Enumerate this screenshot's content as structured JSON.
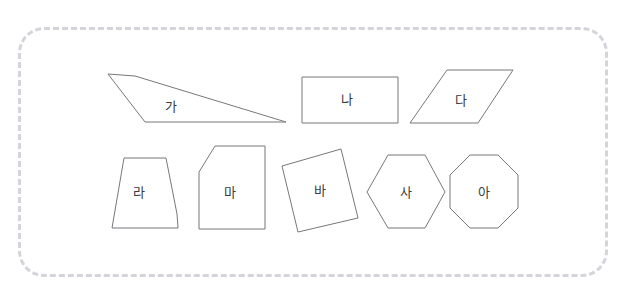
{
  "page": {
    "width": 624,
    "height": 299,
    "background_color": "#ffffff",
    "top_clipped_text": "",
    "frame": {
      "style": "dashed-rounded-rectangle",
      "color": "#d4d4da",
      "x": 18,
      "y": 27,
      "width": 590,
      "height": 250,
      "corner_radius": 26
    },
    "shape_stroke_color": "#77777d",
    "shape_fill_color": "#ffffff",
    "label_color": "#3a3a40"
  },
  "shapes": [
    {
      "id": "shape-ga",
      "label": "가",
      "kind": "quadrilateral",
      "points": "108,74 135,76 286,122 145,122",
      "label_x": 171,
      "label_y": 106
    },
    {
      "id": "shape-na",
      "label": "나",
      "kind": "rectangle",
      "points": "302,77 398,77 398,123 302,123",
      "label_x": 347,
      "label_y": 99
    },
    {
      "id": "shape-da",
      "label": "다",
      "kind": "parallelogram",
      "points": "447,70 513,70 478,123 410,123",
      "label_x": 461,
      "label_y": 100
    },
    {
      "id": "shape-ra",
      "label": "라",
      "kind": "trapezoid-pentagon",
      "points": "124,158 166,158 177,214 178,228 112,228",
      "label_x": 139,
      "label_y": 192
    },
    {
      "id": "shape-ma",
      "label": "마",
      "kind": "pentagon",
      "points": "215,146 265,146 265,229 199,229 199,172",
      "label_x": 230,
      "label_y": 192
    },
    {
      "id": "shape-ba",
      "label": "바",
      "kind": "rotated-square",
      "points": "341,149 358,218 298,232 282,166",
      "label_x": 320,
      "label_y": 190
    },
    {
      "id": "shape-sa",
      "label": "사",
      "kind": "hexagon",
      "points": "388,155 425,155 445,192 425,228 388,228 367,192",
      "label_x": 406,
      "label_y": 192
    },
    {
      "id": "shape-a",
      "label": "아",
      "kind": "octagon",
      "points": "470,155 498,155 518,175 518,208 498,228 470,228 450,208 450,175",
      "label_x": 484,
      "label_y": 192
    }
  ]
}
